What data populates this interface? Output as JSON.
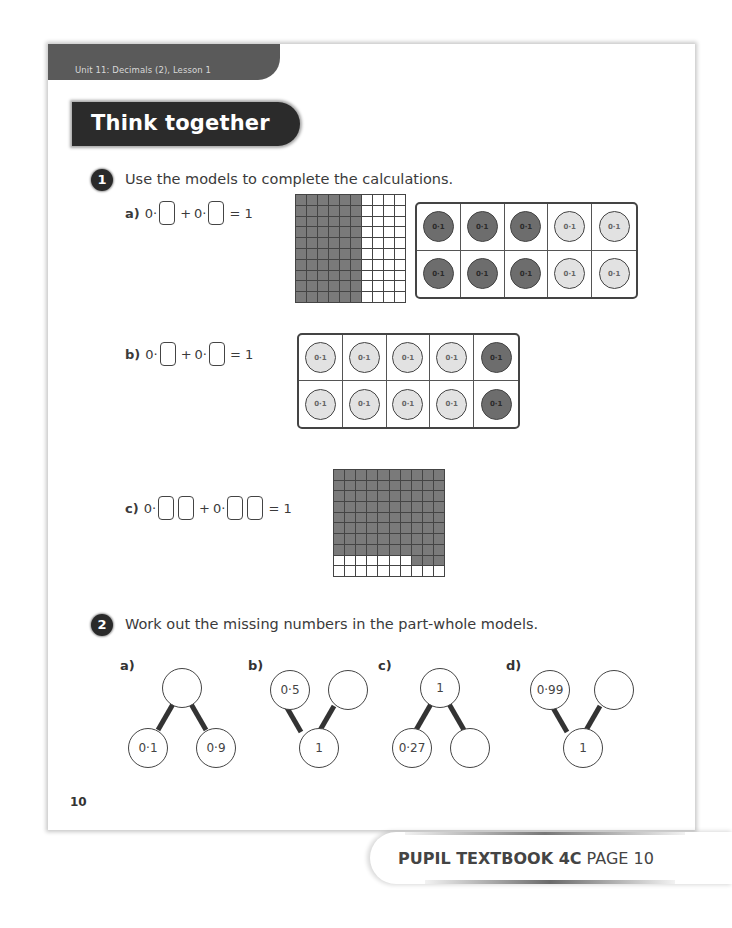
{
  "header": {
    "unit_label": "Unit 11: Decimals (2), Lesson 1",
    "section_title": "Think together"
  },
  "question1": {
    "number": "1",
    "instruction": "Use the models to complete the calculations.",
    "parts": [
      {
        "label": "a)",
        "prefix1": "0·",
        "plus": "+",
        "prefix2": "0·",
        "equals": "= 1",
        "boxes_per_term": 1,
        "hundred_grid": {
          "rows": 10,
          "cols": 10,
          "shaded_columns": 6,
          "shaded_count": 60
        },
        "ten_frame": {
          "counter_label": "0·1",
          "dark_count": 6,
          "light_count": 4,
          "layout": "2 rows x 5: dark in cols 1-3, light in cols 4-5"
        }
      },
      {
        "label": "b)",
        "prefix1": "0·",
        "plus": "+",
        "prefix2": "0·",
        "equals": "= 1",
        "boxes_per_term": 1,
        "ten_frame": {
          "counter_label": "0·1",
          "light_count": 8,
          "dark_count": 2,
          "layout": "2 rows x 5: light in cols 1-4, dark in col 5"
        }
      },
      {
        "label": "c)",
        "prefix1": "0·",
        "plus": "+",
        "prefix2": "0·",
        "equals": "= 1",
        "boxes_per_term": 2,
        "hundred_grid": {
          "rows": 10,
          "cols": 10,
          "shaded_full_rows": 8,
          "row9_shaded_last": 3,
          "shaded_count": 83
        }
      }
    ]
  },
  "question2": {
    "number": "2",
    "instruction": "Work out the missing numbers in the part-whole models.",
    "models": [
      {
        "label": "a)",
        "orientation": "whole-top",
        "whole": "",
        "parts": [
          "0·1",
          "0·9"
        ]
      },
      {
        "label": "b)",
        "orientation": "whole-bottom",
        "whole": "1",
        "parts": [
          "0·5",
          ""
        ]
      },
      {
        "label": "c)",
        "orientation": "whole-top",
        "whole": "1",
        "parts": [
          "0·27",
          ""
        ]
      },
      {
        "label": "d)",
        "orientation": "whole-bottom",
        "whole": "1",
        "parts": [
          "0·99",
          ""
        ]
      }
    ]
  },
  "footer": {
    "page_number": "10",
    "book_label": "PUPIL TEXTBOOK 4C",
    "page_label": "PAGE 10"
  }
}
